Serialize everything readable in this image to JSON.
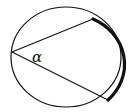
{
  "diagram": {
    "type": "inscribed-angle",
    "angle_label": "α",
    "colors": {
      "stroke": "#111111",
      "background": "#ffffff"
    },
    "circle": {
      "cx": 66,
      "cy": 57,
      "rx": 55,
      "ry": 50
    },
    "vertex": {
      "x": 12,
      "y": 52
    },
    "chord_end_upper": {
      "x": 93,
      "y": 19
    },
    "chord_end_lower": {
      "x": 108,
      "y": 100
    },
    "highlighted_arc": "intercepted arc (bold, right side)"
  }
}
